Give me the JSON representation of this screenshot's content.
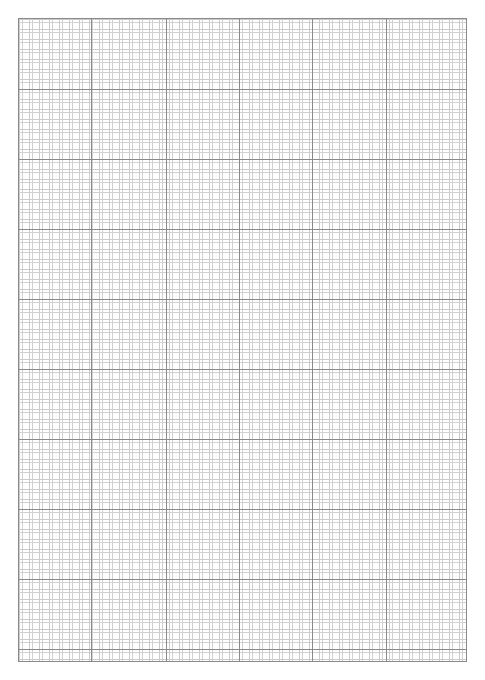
{
  "page": {
    "width": 485,
    "height": 680,
    "background_color": "#ffffff"
  },
  "sheet": {
    "name": "grid-sheet",
    "left": 18,
    "top": 18,
    "width": 449,
    "height": 644,
    "paper_color": "#ffffff",
    "border_color": "#8a8a8a",
    "border_width": 1
  },
  "grid": {
    "minor": {
      "spacing_px": 10,
      "color": "#dcdcdc",
      "style": "dotted",
      "line_width": 1
    },
    "major": {
      "color": "#8a8a8a",
      "line_width": 1,
      "column_spacing_px": 72,
      "row_spacing_px": 70,
      "vertical_offsets": [
        0,
        72,
        147,
        220,
        293,
        367,
        448
      ],
      "horizontal_offsets": [
        0,
        70,
        140,
        210,
        280,
        350,
        420,
        490,
        560,
        630,
        643
      ]
    }
  },
  "chart_data": {
    "type": "table",
    "xlabel": "",
    "ylabel": "",
    "categories": [],
    "values": [],
    "grid": true,
    "legend": "none"
  }
}
